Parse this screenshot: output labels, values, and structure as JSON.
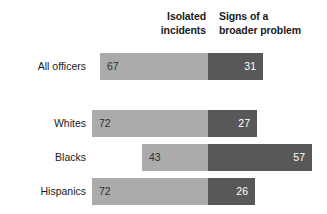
{
  "chart_data": {
    "type": "bar",
    "subtype": "diverging-stacked-bar",
    "title": "",
    "xlabel": "",
    "ylabel": "",
    "categories": [
      "All officers",
      "Whites",
      "Blacks",
      "Hispanics"
    ],
    "series": [
      {
        "name": "Isolated incidents",
        "values": [
          67,
          72,
          43,
          72
        ],
        "color": "#ababab"
      },
      {
        "name": "Signs of a broader problem",
        "values": [
          31,
          27,
          57,
          26
        ],
        "color": "#585858"
      }
    ],
    "legend_position": "top",
    "grid": false,
    "value_labels": true
  },
  "headers": {
    "left": {
      "line1": "Isolated",
      "line2": "incidents"
    },
    "right": {
      "line1": "Signs of a",
      "line2": "broader problem"
    }
  },
  "rows": [
    {
      "label": "All officers",
      "left_value": "67",
      "right_value": "31",
      "left_width_px": 108,
      "right_width_px": 55,
      "top_px": 53
    },
    {
      "label": "Whites",
      "left_value": "72",
      "right_value": "27",
      "left_width_px": 116,
      "right_width_px": 49,
      "top_px": 110
    },
    {
      "label": "Blacks",
      "left_value": "43",
      "right_value": "57",
      "left_width_px": 66,
      "right_width_px": 104,
      "top_px": 144
    },
    {
      "label": "Hispanics",
      "left_value": "72",
      "right_value": "26",
      "left_width_px": 116,
      "right_width_px": 47,
      "top_px": 178
    }
  ],
  "colors": {
    "isolated_incidents": "#ababab",
    "broader_problem": "#585858",
    "text": "#1a1a1a",
    "background": "#ffffff"
  }
}
